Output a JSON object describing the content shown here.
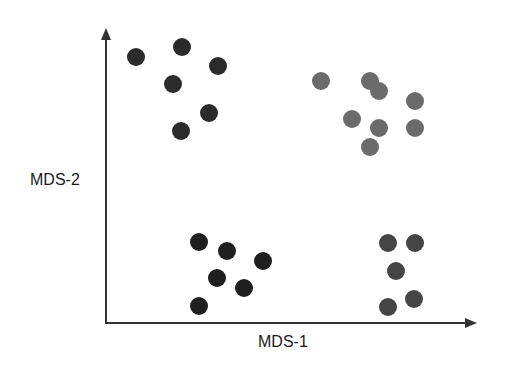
{
  "chart_data": {
    "type": "scatter",
    "title": "",
    "xlabel": "MDS-1",
    "ylabel": "MDS-2",
    "grid": false,
    "legend": null,
    "ticks": false,
    "axis_ranges_px": {
      "x": [
        106,
        475
      ],
      "y": [
        323,
        30
      ]
    },
    "series": [
      {
        "name": "cluster-top-left",
        "color": "#2b2b2b",
        "points_px": [
          [
            136,
            57
          ],
          [
            182,
            47
          ],
          [
            218,
            66
          ],
          [
            173,
            84
          ],
          [
            209,
            113
          ],
          [
            181,
            131
          ]
        ]
      },
      {
        "name": "cluster-top-right",
        "color": "#6b6b6b",
        "points_px": [
          [
            321,
            81
          ],
          [
            370,
            81
          ],
          [
            379,
            91
          ],
          [
            415,
            101
          ],
          [
            352,
            119
          ],
          [
            379,
            128
          ],
          [
            415,
            128
          ],
          [
            370,
            147
          ]
        ]
      },
      {
        "name": "cluster-bottom-left",
        "color": "#1f1f1f",
        "points_px": [
          [
            199,
            242
          ],
          [
            227,
            251
          ],
          [
            263,
            261
          ],
          [
            217,
            278
          ],
          [
            244,
            288
          ],
          [
            199,
            306
          ]
        ]
      },
      {
        "name": "cluster-bottom-right",
        "color": "#454545",
        "points_px": [
          [
            388,
            243
          ],
          [
            415,
            243
          ],
          [
            396,
            271
          ],
          [
            414,
            299
          ],
          [
            388,
            307
          ]
        ]
      }
    ],
    "marker_radius_px": 9,
    "axis_color": "#333333"
  }
}
